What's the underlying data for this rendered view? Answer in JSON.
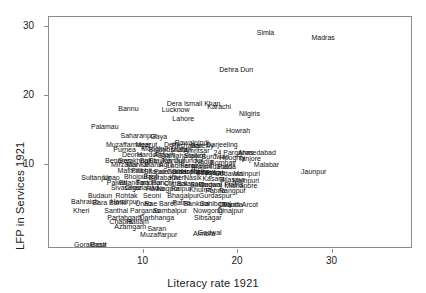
{
  "chart_data": {
    "type": "scatter",
    "title": "",
    "xlabel": "Literacy rate 1921",
    "ylabel": "LFP in Services 1921",
    "xlim": [
      0,
      38.5
    ],
    "ylim": [
      -2.2,
      31.5
    ],
    "xticks": [
      10,
      20,
      30
    ],
    "yticks": [
      10,
      20,
      30
    ],
    "grid": false,
    "legend": null,
    "marker_style": "text-label",
    "note": "Each data point is drawn as its district name; heavy overplotting in the central cluster.",
    "points": [
      {
        "label": "Simla",
        "x": 22.9,
        "y": 29.3
      },
      {
        "label": "Madras",
        "x": 29.0,
        "y": 28.6
      },
      {
        "label": "Dehra Dun",
        "x": 19.8,
        "y": 24.0
      },
      {
        "label": "Dera Ismail Khan",
        "x": 15.3,
        "y": 19.0
      },
      {
        "label": "Karachi",
        "x": 18.0,
        "y": 18.6
      },
      {
        "label": "Lucknow",
        "x": 13.4,
        "y": 18.1
      },
      {
        "label": "Bannu",
        "x": 8.4,
        "y": 18.3
      },
      {
        "label": "Nilgiris",
        "x": 21.2,
        "y": 17.6
      },
      {
        "label": "Lahore",
        "x": 14.2,
        "y": 16.9
      },
      {
        "label": "Palamau",
        "x": 5.9,
        "y": 15.6
      },
      {
        "label": "Howrah",
        "x": 20.0,
        "y": 15.1
      },
      {
        "label": "Saharanpur",
        "x": 9.5,
        "y": 14.3
      },
      {
        "label": "Gaya",
        "x": 11.6,
        "y": 14.2
      },
      {
        "label": "Rawalpindi",
        "x": 15.1,
        "y": 13.4
      },
      {
        "label": "Darjeeling",
        "x": 18.3,
        "y": 13.0
      },
      {
        "label": "Muzaffarnagar",
        "x": 8.4,
        "y": 13.1
      },
      {
        "label": "Meerut",
        "x": 10.3,
        "y": 13.0
      },
      {
        "label": "Delhi",
        "x": 13.0,
        "y": 13.0
      },
      {
        "label": "Peshawar",
        "x": 14.6,
        "y": 12.9
      },
      {
        "label": "Bareilly",
        "x": 16.2,
        "y": 12.9
      },
      {
        "label": "Purnea",
        "x": 8.0,
        "y": 12.3
      },
      {
        "label": "Monghyr",
        "x": 11.2,
        "y": 12.4
      },
      {
        "label": "Bulandshahr",
        "x": 12.6,
        "y": 12.3
      },
      {
        "label": "Multan",
        "x": 14.0,
        "y": 12.3
      },
      {
        "label": "Amritsar",
        "x": 15.6,
        "y": 12.2
      },
      {
        "label": "24 Parganas",
        "x": 19.5,
        "y": 11.9
      },
      {
        "label": "Ahmedabad",
        "x": 22.0,
        "y": 11.9
      },
      {
        "label": "Deoria",
        "x": 8.8,
        "y": 11.6
      },
      {
        "label": "Hardoi",
        "x": 10.4,
        "y": 11.6
      },
      {
        "label": "Aligarh",
        "x": 12.2,
        "y": 11.6
      },
      {
        "label": "Shahjahanpur",
        "x": 13.8,
        "y": 11.5
      },
      {
        "label": "Sialkot",
        "x": 15.4,
        "y": 11.4
      },
      {
        "label": "Burdwan",
        "x": 17.6,
        "y": 11.3
      },
      {
        "label": "Hooghly",
        "x": 19.4,
        "y": 11.2
      },
      {
        "label": "Tanjore",
        "x": 21.2,
        "y": 11.0
      },
      {
        "label": "Benares",
        "x": 7.3,
        "y": 10.8
      },
      {
        "label": "Gorakhpur",
        "x": 9.0,
        "y": 10.8
      },
      {
        "label": "Ballia",
        "x": 10.5,
        "y": 10.8
      },
      {
        "label": "Etawah",
        "x": 11.8,
        "y": 10.8
      },
      {
        "label": "Kanpur",
        "x": 13.2,
        "y": 10.7
      },
      {
        "label": "Jullundur",
        "x": 14.8,
        "y": 10.7
      },
      {
        "label": "Nadia",
        "x": 16.4,
        "y": 10.6
      },
      {
        "label": "Bombay",
        "x": 18.4,
        "y": 10.5
      },
      {
        "label": "Malabar",
        "x": 23.0,
        "y": 10.2
      },
      {
        "label": "Mirzapur",
        "x": 8.0,
        "y": 10.2
      },
      {
        "label": "Marwar",
        "x": 9.4,
        "y": 10.1
      },
      {
        "label": "Jhansi",
        "x": 11.0,
        "y": 10.1
      },
      {
        "label": "Agra",
        "x": 12.4,
        "y": 10.1
      },
      {
        "label": "Ludhiana",
        "x": 14.0,
        "y": 10.0
      },
      {
        "label": "Ferozepur",
        "x": 15.6,
        "y": 10.0
      },
      {
        "label": "Murshidabad",
        "x": 17.2,
        "y": 9.9
      },
      {
        "label": "Patna",
        "x": 18.8,
        "y": 9.8
      },
      {
        "label": "Bihar Plains",
        "x": 15.0,
        "y": 9.2
      },
      {
        "label": "Bhagwat",
        "x": 17.0,
        "y": 9.0
      },
      {
        "label": "Mainpuri",
        "x": 20.9,
        "y": 8.9
      },
      {
        "label": "Jaunpur",
        "x": 28.0,
        "y": 9.2
      },
      {
        "label": "Mathura",
        "x": 8.6,
        "y": 9.3
      },
      {
        "label": "Pilibhit",
        "x": 9.8,
        "y": 9.3
      },
      {
        "label": "Sitapur",
        "x": 11.2,
        "y": 9.2
      },
      {
        "label": "Fatehpur",
        "x": 12.6,
        "y": 9.2
      },
      {
        "label": "Gurdaspur",
        "x": 14.2,
        "y": 9.1
      },
      {
        "label": "Hoshiarpur",
        "x": 15.8,
        "y": 9.1
      },
      {
        "label": "Jessore",
        "x": 17.4,
        "y": 9.0
      },
      {
        "label": "Godavari",
        "x": 19.0,
        "y": 8.9
      },
      {
        "label": "Sultanpur",
        "x": 5.0,
        "y": 8.2
      },
      {
        "label": "Unao",
        "x": 6.6,
        "y": 8.2
      },
      {
        "label": "Bhojpur",
        "x": 9.2,
        "y": 8.4
      },
      {
        "label": "Basti",
        "x": 10.8,
        "y": 8.4
      },
      {
        "label": "Barabanki",
        "x": 12.2,
        "y": 8.3
      },
      {
        "label": "Kheri",
        "x": 13.6,
        "y": 8.3
      },
      {
        "label": "Nasik",
        "x": 15.2,
        "y": 8.2
      },
      {
        "label": "Kasara",
        "x": 17.4,
        "y": 8.1
      },
      {
        "label": "Bilaspur",
        "x": 19.4,
        "y": 8.0
      },
      {
        "label": "Mainpuri",
        "x": 20.8,
        "y": 7.8
      },
      {
        "label": "Palwal",
        "x": 7.2,
        "y": 7.6
      },
      {
        "label": "Bhandara",
        "x": 9.0,
        "y": 7.6
      },
      {
        "label": "Faridpur",
        "x": 10.6,
        "y": 7.5
      },
      {
        "label": "Ranchi",
        "x": 12.0,
        "y": 7.5
      },
      {
        "label": "Cuttack",
        "x": 13.4,
        "y": 7.4
      },
      {
        "label": "Balasore",
        "x": 15.0,
        "y": 7.4
      },
      {
        "label": "Bakarganj",
        "x": 16.6,
        "y": 7.3
      },
      {
        "label": "Gadwal Plains",
        "x": 18.2,
        "y": 7.3
      },
      {
        "label": "Midnapore",
        "x": 20.3,
        "y": 7.1
      },
      {
        "label": "Sivasagar",
        "x": 8.2,
        "y": 6.8
      },
      {
        "label": "Ghaziabad",
        "x": 9.8,
        "y": 6.8
      },
      {
        "label": "Hawa",
        "x": 11.2,
        "y": 6.7
      },
      {
        "label": "Nagpur",
        "x": 12.6,
        "y": 6.7
      },
      {
        "label": "Raipur",
        "x": 14.0,
        "y": 6.6
      },
      {
        "label": "Khulna",
        "x": 16.0,
        "y": 6.5
      },
      {
        "label": "Pabna",
        "x": 17.6,
        "y": 6.4
      },
      {
        "label": "Rangpur",
        "x": 19.4,
        "y": 6.3
      },
      {
        "label": "Budaun",
        "x": 5.4,
        "y": 5.6
      },
      {
        "label": "Rohtak",
        "x": 8.2,
        "y": 5.6
      },
      {
        "label": "Seoni",
        "x": 10.9,
        "y": 5.6
      },
      {
        "label": "Bhagalpur",
        "x": 14.2,
        "y": 5.6
      },
      {
        "label": "Gurdaspur",
        "x": 17.6,
        "y": 5.6
      },
      {
        "label": "Bahraich",
        "x": 3.8,
        "y": 4.7
      },
      {
        "label": "Bara Banki",
        "x": 6.4,
        "y": 4.6
      },
      {
        "label": "Hamirpur",
        "x": 8.0,
        "y": 4.7
      },
      {
        "label": "Unao",
        "x": 10.0,
        "y": 4.5
      },
      {
        "label": "Rae Bareli",
        "x": 11.8,
        "y": 4.5
      },
      {
        "label": "Patna",
        "x": 14.0,
        "y": 4.6
      },
      {
        "label": "Bankura",
        "x": 15.6,
        "y": 4.5
      },
      {
        "label": "Sahibganj",
        "x": 17.6,
        "y": 4.5
      },
      {
        "label": "Chanda",
        "x": 19.2,
        "y": 4.4
      },
      {
        "label": "South Arcot",
        "x": 20.2,
        "y": 4.3
      },
      {
        "label": "Kheri",
        "x": 3.4,
        "y": 3.4
      },
      {
        "label": "Santhal Parganas",
        "x": 8.8,
        "y": 3.5
      },
      {
        "label": "Sambalpur",
        "x": 12.8,
        "y": 3.5
      },
      {
        "label": "Nowgong",
        "x": 16.8,
        "y": 3.5
      },
      {
        "label": "Dinajpur",
        "x": 19.2,
        "y": 3.4
      },
      {
        "label": "Partabgarh",
        "x": 8.0,
        "y": 2.5
      },
      {
        "label": "Darbhanga",
        "x": 11.4,
        "y": 2.5
      },
      {
        "label": "Sibsagar",
        "x": 16.8,
        "y": 2.4
      },
      {
        "label": "Chapra",
        "x": 7.6,
        "y": 1.8
      },
      {
        "label": "Ratlam",
        "x": 9.4,
        "y": 1.8
      },
      {
        "label": "Azamgarh",
        "x": 8.6,
        "y": 1.1
      },
      {
        "label": "Saran",
        "x": 11.4,
        "y": 0.9
      },
      {
        "label": "Muzaffarpur",
        "x": 11.6,
        "y": 0.0
      },
      {
        "label": "Almora",
        "x": 16.4,
        "y": 0.1
      },
      {
        "label": "Gadwal",
        "x": 17.0,
        "y": 0.3
      },
      {
        "label": "Gorakhpur",
        "x": 4.4,
        "y": -1.5
      },
      {
        "label": "Basti",
        "x": 5.2,
        "y": -1.5
      }
    ]
  }
}
